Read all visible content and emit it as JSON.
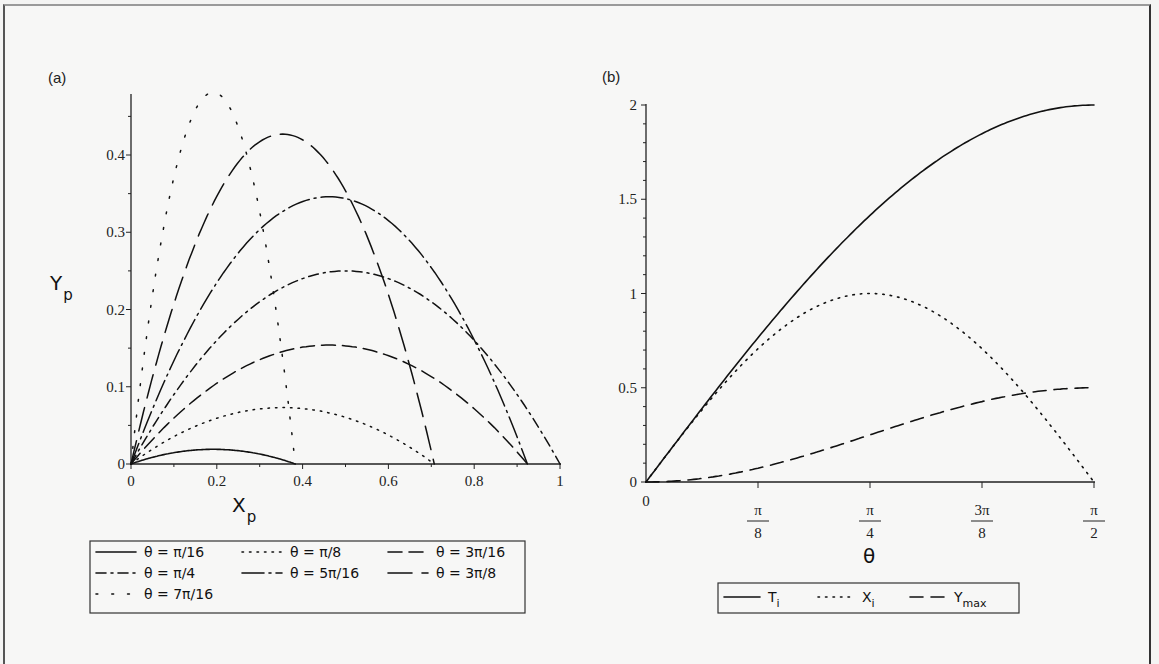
{
  "chart_data": [
    {
      "type": "line",
      "panel_label": "(a)",
      "title": "",
      "xlabel": "X_p",
      "ylabel": "Y_p",
      "xlim": [
        0,
        1
      ],
      "ylim": [
        0,
        0.48
      ],
      "x_ticks": [
        "0",
        "0.2",
        "0.4",
        "0.6",
        "0.8",
        "1"
      ],
      "y_ticks": [
        "0",
        "0.1",
        "0.2",
        "0.3",
        "0.4"
      ],
      "grid": false,
      "legend_position": "below",
      "series": [
        {
          "name": "θ = π/16",
          "style": "solid",
          "range": 0.383,
          "peak": {
            "x": 0.191,
            "y": 0.019
          }
        },
        {
          "name": "θ = π/8",
          "style": "dotted",
          "range": 0.707,
          "peak": {
            "x": 0.354,
            "y": 0.073
          }
        },
        {
          "name": "θ = 3π/16",
          "style": "dash",
          "range": 0.924,
          "peak": {
            "x": 0.462,
            "y": 0.154
          }
        },
        {
          "name": "θ = π/4",
          "style": "dash-dot",
          "range": 1.0,
          "peak": {
            "x": 0.5,
            "y": 0.25
          }
        },
        {
          "name": "θ = 5π/16",
          "style": "long-dash-dot",
          "range": 0.924,
          "peak": {
            "x": 0.462,
            "y": 0.346
          }
        },
        {
          "name": "θ = 3π/8",
          "style": "long-dash",
          "range": 0.707,
          "peak": {
            "x": 0.354,
            "y": 0.427
          }
        },
        {
          "name": "θ = 7π/16",
          "style": "sparse-dot",
          "range": 0.383,
          "peak": {
            "x": 0.191,
            "y": 0.481
          }
        }
      ]
    },
    {
      "type": "line",
      "panel_label": "(b)",
      "title": "",
      "xlabel": "θ",
      "ylabel": "",
      "xlim": [
        0,
        1.5708
      ],
      "ylim": [
        0,
        2
      ],
      "x_ticks": [
        {
          "num": "0",
          "den": ""
        },
        {
          "num": "π",
          "den": "8"
        },
        {
          "num": "π",
          "den": "4"
        },
        {
          "num": "3π",
          "den": "8"
        },
        {
          "num": "π",
          "den": "2"
        }
      ],
      "y_ticks": [
        "0",
        "0.5",
        "1",
        "1.5",
        "2"
      ],
      "grid": false,
      "legend_position": "below",
      "categories": [
        "0",
        "π/16",
        "π/8",
        "3π/16",
        "π/4",
        "5π/16",
        "3π/8",
        "7π/16",
        "π/2"
      ],
      "series": [
        {
          "name": "T_i",
          "style": "solid",
          "values": [
            0,
            0.39,
            0.765,
            1.111,
            1.414,
            1.663,
            1.848,
            1.962,
            2.0
          ]
        },
        {
          "name": "X_i",
          "style": "dotted",
          "values": [
            0,
            0.383,
            0.707,
            0.924,
            1.0,
            0.924,
            0.707,
            0.383,
            0
          ]
        },
        {
          "name": "Y_max",
          "style": "dash",
          "values": [
            0,
            0.019,
            0.073,
            0.154,
            0.25,
            0.346,
            0.427,
            0.481,
            0.5
          ]
        }
      ]
    }
  ],
  "panel_a": {
    "label": "(a)",
    "y_axis_title": "Y",
    "y_axis_sub": "p",
    "x_axis_title": "X",
    "x_axis_sub": "p",
    "y_ticks": [
      "0",
      "0.1",
      "0.2",
      "0.3",
      "0.4"
    ],
    "x_ticks": [
      "0",
      "0.2",
      "0.4",
      "0.6",
      "0.8",
      "1"
    ],
    "legend": [
      "θ = π/16",
      "θ = π/8",
      "θ = 3π/16",
      "θ = π/4",
      "θ = 5π/16",
      "θ = 3π/8",
      "θ = 7π/16"
    ]
  },
  "panel_b": {
    "label": "(b)",
    "x_axis_title": "θ",
    "y_ticks": [
      "0",
      "0.5",
      "1",
      "1.5",
      "2"
    ],
    "x_tick_zero": "0",
    "x_ticks": [
      {
        "num": "π",
        "den": "8"
      },
      {
        "num": "π",
        "den": "4"
      },
      {
        "num": "3π",
        "den": "8"
      },
      {
        "num": "π",
        "den": "2"
      }
    ],
    "legend": [
      {
        "main": "T",
        "sub": "i"
      },
      {
        "main": "X",
        "sub": "i"
      },
      {
        "main": "Y",
        "sub": "max"
      }
    ]
  }
}
